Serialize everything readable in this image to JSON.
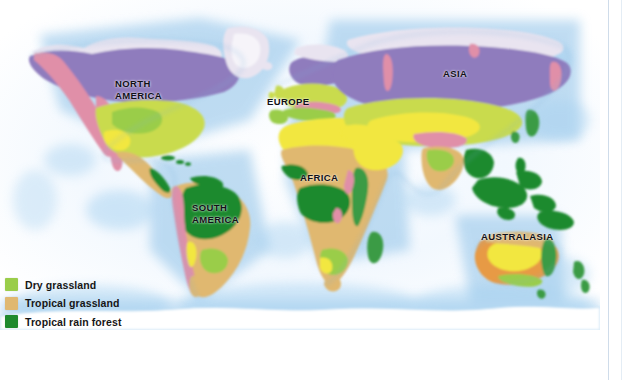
{
  "figure": {
    "kind": "world-biome-map",
    "labels": [
      {
        "id": "north-america",
        "text": "NORTH\nAMERICA"
      },
      {
        "id": "south-america",
        "text": "SOUTH\nAMERICA"
      },
      {
        "id": "europe",
        "text": "EUROPE"
      },
      {
        "id": "africa",
        "text": "AFRICA"
      },
      {
        "id": "asia",
        "text": "ASIA"
      },
      {
        "id": "australasia",
        "text": "AUSTRALASIA"
      }
    ]
  },
  "legend": {
    "items": [
      {
        "label": "Dry grassland",
        "color": "#9ACD4A"
      },
      {
        "label": "Tropical grassland",
        "color": "#E0B870"
      },
      {
        "label": "Tropical rain forest",
        "color": "#1F8A2E"
      }
    ]
  },
  "palette": {
    "ocean_near": "#cfe4f7",
    "ocean_far": "#ffffff",
    "tundra": "#e9e4f0",
    "boreal": "#8f7bbd",
    "mountain": "#e08fa8",
    "temperate": "#c9db4e",
    "dry_grass": "#9ACD4A",
    "desert": "#f2e73f",
    "trop_grass": "#E0B870",
    "rainforest": "#1F8A2E",
    "scrub": "#e79a45",
    "coast_line": "#7fb3dd",
    "label_ink": "#111018",
    "rule": "#cfdcea"
  }
}
